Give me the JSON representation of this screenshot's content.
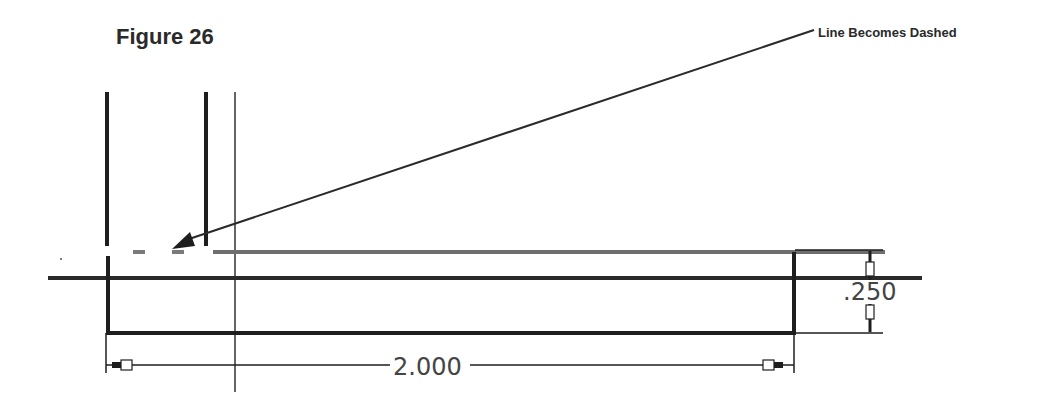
{
  "figure": {
    "title": "Figure 26",
    "callout_label": "Line Becomes Dashed"
  },
  "dimensions": {
    "horizontal": ".250",
    "length": "2.000"
  },
  "colors": {
    "line": "#1e1e1e",
    "dashed_line": "#7a7a7a",
    "dim_text": "#444444"
  }
}
